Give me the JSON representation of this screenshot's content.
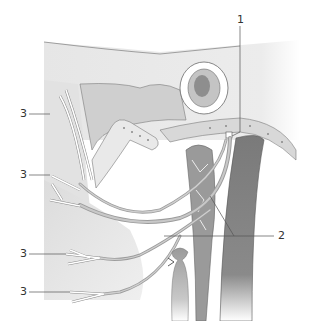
{
  "figure": {
    "type": "anatomical-illustration",
    "labels": [
      {
        "id": "1",
        "text": "1",
        "x": 238,
        "y": 14
      },
      {
        "id": "2",
        "text": "2",
        "x": 278,
        "y": 231
      },
      {
        "id": "3a",
        "text": "3",
        "x": 20,
        "y": 110
      },
      {
        "id": "3b",
        "text": "3",
        "x": 20,
        "y": 171
      },
      {
        "id": "3c",
        "text": "3",
        "x": 20,
        "y": 250
      },
      {
        "id": "3d",
        "text": "3",
        "x": 20,
        "y": 288
      }
    ],
    "colors": {
      "background": "#ffffff",
      "tissue_light": "#ececec",
      "tissue_mid": "#d6d6d6",
      "muscle": "#c9c9c9",
      "bone": "#dadada",
      "vessel_dark": "#6e6e6e",
      "vessel_mid": "#8f8f8f",
      "nerve": "#a8a8a8",
      "outline": "#6a6a6a",
      "leader_line": "#555555"
    }
  }
}
